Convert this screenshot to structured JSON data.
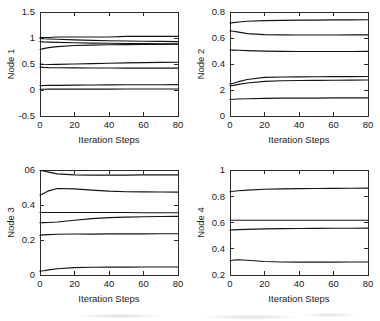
{
  "figure": {
    "title": "",
    "layout": "2x2 grid of line plots",
    "background_color": "#ffffff",
    "line_color": "#141414",
    "axis_color": "#2b2b2b"
  },
  "chart_data": [
    {
      "type": "line",
      "title": "",
      "panel_label": "Node 1",
      "xlabel": "Iteration Steps",
      "ylabel": "Node 1",
      "xlim": [
        0,
        80
      ],
      "ylim": [
        -0.5,
        1.5
      ],
      "xticks": [
        0,
        20,
        40,
        60,
        80
      ],
      "xtick_labels": [
        "0",
        "20",
        "40",
        "60",
        "80"
      ],
      "yticks": [
        -0.5,
        0,
        0.5,
        1,
        1.5
      ],
      "ytick_labels": [
        "-0.5",
        "0",
        "0.5",
        "1",
        "1.5"
      ],
      "grid": false,
      "legend": null,
      "x": [
        0,
        2,
        5,
        10,
        20,
        30,
        40,
        50,
        60,
        70,
        80
      ],
      "series": [
        {
          "name": "trace-1",
          "values": [
            1.01,
            1.01,
            1.01,
            1.02,
            1.02,
            1.02,
            1.02,
            1.03,
            1.03,
            1.03,
            1.03
          ]
        },
        {
          "name": "trace-2",
          "values": [
            0.99,
            0.985,
            0.98,
            0.975,
            0.965,
            0.955,
            0.948,
            0.942,
            0.938,
            0.934,
            0.93
          ]
        },
        {
          "name": "trace-3",
          "values": [
            0.93,
            0.925,
            0.92,
            0.915,
            0.908,
            0.902,
            0.898,
            0.894,
            0.891,
            0.889,
            0.887
          ]
        },
        {
          "name": "trace-4",
          "values": [
            0.78,
            0.795,
            0.815,
            0.835,
            0.855,
            0.864,
            0.87,
            0.873,
            0.876,
            0.878,
            0.88
          ]
        },
        {
          "name": "trace-5",
          "values": [
            0.5,
            0.495,
            0.49,
            0.492,
            0.5,
            0.508,
            0.515,
            0.521,
            0.526,
            0.53,
            0.534
          ]
        },
        {
          "name": "trace-6",
          "values": [
            0.44,
            0.435,
            0.43,
            0.428,
            0.426,
            0.424,
            0.423,
            0.422,
            0.421,
            0.4205,
            0.42
          ]
        },
        {
          "name": "trace-7",
          "values": [
            0.085,
            0.086,
            0.088,
            0.09,
            0.093,
            0.096,
            0.098,
            0.1,
            0.101,
            0.102,
            0.103
          ]
        },
        {
          "name": "trace-8",
          "values": [
            0.015,
            0.015,
            0.016,
            0.016,
            0.017,
            0.018,
            0.018,
            0.019,
            0.019,
            0.02,
            0.02
          ]
        }
      ]
    },
    {
      "type": "line",
      "title": "",
      "panel_label": "Node 2",
      "xlabel": "Iteration Steps",
      "ylabel": "Node 2",
      "xlim": [
        0,
        80
      ],
      "ylim": [
        0,
        0.8
      ],
      "xticks": [
        0,
        20,
        40,
        60,
        80
      ],
      "xtick_labels": [
        "0",
        "20",
        "40",
        "60",
        "80"
      ],
      "yticks": [
        0,
        0.2,
        0.4,
        0.6,
        0.8
      ],
      "ytick_labels": [
        "0",
        "2",
        "0.4",
        "0.6",
        "0.8"
      ],
      "ytick_labels_note": "0.2 tick prints as '2' in the scanned source",
      "grid": false,
      "legend": null,
      "x": [
        0,
        2,
        5,
        10,
        20,
        30,
        40,
        50,
        60,
        70,
        80
      ],
      "series": [
        {
          "name": "trace-1",
          "values": [
            0.715,
            0.718,
            0.723,
            0.729,
            0.734,
            0.736,
            0.737,
            0.738,
            0.739,
            0.739,
            0.74
          ]
        },
        {
          "name": "trace-2",
          "values": [
            0.655,
            0.652,
            0.645,
            0.634,
            0.626,
            0.624,
            0.623,
            0.623,
            0.623,
            0.624,
            0.624
          ]
        },
        {
          "name": "trace-3",
          "values": [
            0.508,
            0.507,
            0.506,
            0.503,
            0.499,
            0.497,
            0.496,
            0.496,
            0.496,
            0.496,
            0.497
          ]
        },
        {
          "name": "trace-4",
          "values": [
            0.245,
            0.252,
            0.264,
            0.281,
            0.297,
            0.3,
            0.301,
            0.302,
            0.303,
            0.303,
            0.304
          ]
        },
        {
          "name": "trace-5",
          "values": [
            0.232,
            0.236,
            0.243,
            0.254,
            0.266,
            0.271,
            0.273,
            0.274,
            0.275,
            0.276,
            0.277
          ]
        },
        {
          "name": "trace-6",
          "values": [
            0.128,
            0.129,
            0.131,
            0.133,
            0.136,
            0.137,
            0.138,
            0.138,
            0.139,
            0.139,
            0.139
          ]
        }
      ]
    },
    {
      "type": "line",
      "title": "",
      "panel_label": "Node 3",
      "xlabel": "Iteration Steps",
      "ylabel": "Node 3",
      "xlim": [
        0,
        80
      ],
      "ylim": [
        0,
        0.6
      ],
      "xticks": [
        0,
        20,
        40,
        60,
        80
      ],
      "xtick_labels": [
        "0",
        "20",
        "40",
        "60",
        "80"
      ],
      "yticks": [
        0,
        0.2,
        0.4,
        0.6
      ],
      "ytick_labels": [
        "0",
        "0.2",
        "0.4",
        "06"
      ],
      "ytick_labels_note": "0.6 tick prints as '06' in the scanned source",
      "grid": false,
      "legend": null,
      "x": [
        0,
        2,
        5,
        10,
        20,
        30,
        40,
        50,
        60,
        70,
        80
      ],
      "series": [
        {
          "name": "trace-1",
          "values": [
            0.597,
            0.594,
            0.588,
            0.578,
            0.572,
            0.571,
            0.571,
            0.571,
            0.572,
            0.572,
            0.572
          ]
        },
        {
          "name": "trace-2",
          "values": [
            0.456,
            0.466,
            0.481,
            0.494,
            0.492,
            0.485,
            0.479,
            0.476,
            0.475,
            0.474,
            0.474
          ]
        },
        {
          "name": "trace-3",
          "values": [
            0.357,
            0.357,
            0.357,
            0.357,
            0.357,
            0.357,
            0.357,
            0.357,
            0.356,
            0.356,
            0.356
          ]
        },
        {
          "name": "trace-4",
          "values": [
            0.299,
            0.299,
            0.3,
            0.303,
            0.313,
            0.322,
            0.328,
            0.331,
            0.333,
            0.334,
            0.335
          ]
        },
        {
          "name": "trace-5",
          "values": [
            0.228,
            0.229,
            0.231,
            0.233,
            0.234,
            0.234,
            0.235,
            0.235,
            0.235,
            0.236,
            0.236
          ]
        },
        {
          "name": "trace-6",
          "values": [
            0.022,
            0.024,
            0.029,
            0.036,
            0.042,
            0.044,
            0.045,
            0.045,
            0.046,
            0.046,
            0.046
          ]
        }
      ]
    },
    {
      "type": "line",
      "title": "",
      "panel_label": "Node 4",
      "xlabel": "Iteration Steps",
      "ylabel": "Node 4",
      "xlim": [
        0.2,
        1.0
      ],
      "ylim": [
        0.2,
        1.0
      ],
      "xticks": [
        0,
        20,
        40,
        60,
        80
      ],
      "xtick_labels": [
        "0",
        "20",
        "40",
        "60",
        "80"
      ],
      "yticks": [
        0.2,
        0.4,
        0.6,
        0.8,
        1.0
      ],
      "ytick_labels": [
        "0.2",
        "0.4",
        "0.6",
        "0.8",
        "1"
      ],
      "grid": false,
      "legend": null,
      "x": [
        0,
        2,
        5,
        10,
        20,
        30,
        40,
        50,
        60,
        70,
        80
      ],
      "series": [
        {
          "name": "trace-1",
          "values": [
            0.835,
            0.838,
            0.842,
            0.847,
            0.853,
            0.856,
            0.858,
            0.859,
            0.86,
            0.861,
            0.862
          ]
        },
        {
          "name": "trace-2",
          "values": [
            0.617,
            0.617,
            0.617,
            0.617,
            0.617,
            0.617,
            0.617,
            0.617,
            0.617,
            0.617,
            0.617
          ]
        },
        {
          "name": "trace-3",
          "values": [
            0.543,
            0.544,
            0.546,
            0.548,
            0.551,
            0.553,
            0.554,
            0.555,
            0.556,
            0.556,
            0.557
          ]
        },
        {
          "name": "trace-4",
          "values": [
            0.308,
            0.314,
            0.316,
            0.312,
            0.303,
            0.299,
            0.298,
            0.298,
            0.298,
            0.299,
            0.299
          ]
        }
      ]
    }
  ]
}
